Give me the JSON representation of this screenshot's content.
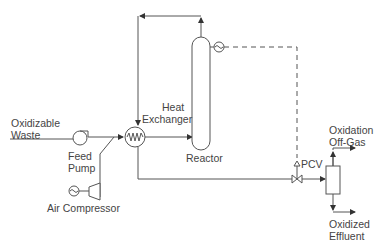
{
  "diagram": {
    "title": "",
    "labels": {
      "oxidizable_waste": [
        "Oxidizable",
        "Waste"
      ],
      "feed_pump": [
        "Feed",
        "Pump"
      ],
      "air_compressor": "Air Compressor",
      "heat_exchanger": [
        "Heat",
        "Exchanger"
      ],
      "reactor": "Reactor",
      "pcv": "PCV",
      "oxidation_off_gas": [
        "Oxidation",
        "Off-Gas"
      ],
      "oxidized_effluent": [
        "Oxidized",
        "Effluent"
      ]
    },
    "nodes": [
      {
        "id": "feed-pump",
        "type": "pump"
      },
      {
        "id": "air-compressor",
        "type": "compressor"
      },
      {
        "id": "motor",
        "type": "motor"
      },
      {
        "id": "heat-exchanger",
        "type": "heat-exchanger"
      },
      {
        "id": "reactor",
        "type": "vessel"
      },
      {
        "id": "sensor",
        "type": "pressure-sensor"
      },
      {
        "id": "pcv",
        "type": "pressure-control-valve"
      },
      {
        "id": "separator",
        "type": "separator"
      }
    ],
    "edges": [
      {
        "from": "oxidizable-waste",
        "to": "feed-pump"
      },
      {
        "from": "feed-pump",
        "to": "heat-exchanger"
      },
      {
        "from": "air-compressor",
        "to": "heat-exchanger"
      },
      {
        "from": "heat-exchanger",
        "to": "reactor"
      },
      {
        "from": "reactor",
        "to": "heat-exchanger",
        "note": "top recycle loop"
      },
      {
        "from": "heat-exchanger",
        "to": "pcv"
      },
      {
        "from": "pcv",
        "to": "separator"
      },
      {
        "from": "separator",
        "to": "oxidation-off-gas"
      },
      {
        "from": "separator",
        "to": "oxidized-effluent"
      },
      {
        "from": "sensor",
        "to": "pcv",
        "style": "dashed",
        "note": "control signal"
      }
    ],
    "colors": {
      "line": "#555555",
      "text": "#444444"
    }
  }
}
